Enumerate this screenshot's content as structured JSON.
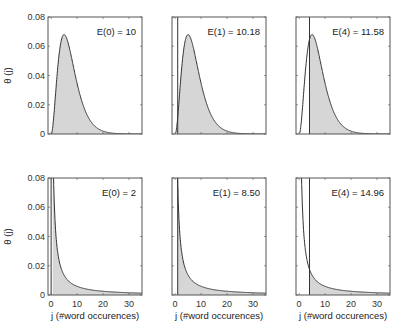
{
  "figure": {
    "ylabel": "θ (j)",
    "xlabel": "j  (#word occurences)",
    "colors": {
      "fill": "#d6d6d6",
      "line": "#333333",
      "frame": "#555555"
    }
  },
  "chart_data": [
    {
      "type": "area",
      "row": 0,
      "col": 0,
      "annotation": "E(0) = 10",
      "shape": "unimodal",
      "peak_j": 5,
      "peak_value": 0.068,
      "shade_from_j": 0,
      "vline_j": null,
      "xlim": [
        -1.2,
        35
      ],
      "ylim": [
        0,
        0.08
      ],
      "yticks": [
        "0",
        "0.02",
        "0.04",
        "0.06",
        "0.08"
      ],
      "ylabel": "θ (j)",
      "xticks": []
    },
    {
      "type": "area",
      "row": 0,
      "col": 1,
      "annotation": "E(1) = 10.18",
      "shape": "unimodal",
      "peak_j": 5,
      "peak_value": 0.068,
      "shade_from_j": 1,
      "vline_j": 1,
      "xlim": [
        -1.2,
        35
      ],
      "ylim": [
        0,
        0.08
      ],
      "yticks": [],
      "xticks": []
    },
    {
      "type": "area",
      "row": 0,
      "col": 2,
      "annotation": "E(4) = 11.58",
      "shape": "unimodal",
      "peak_j": 5,
      "peak_value": 0.068,
      "shade_from_j": 4,
      "vline_j": 4,
      "xlim": [
        -1.2,
        35
      ],
      "ylim": [
        0,
        0.08
      ],
      "yticks": [],
      "xticks": []
    },
    {
      "type": "area",
      "row": 1,
      "col": 0,
      "annotation": "E(0) = 2",
      "shape": "decay",
      "shade_from_j": 0,
      "vline_j": 0,
      "xlim": [
        -1.2,
        35
      ],
      "ylim": [
        0,
        0.08
      ],
      "yticks": [
        "0",
        "0.02",
        "0.04",
        "0.06",
        "0.08"
      ],
      "ylabel": "θ (j)",
      "xticks": [
        "0",
        "10",
        "20",
        "30"
      ],
      "xlabel": "j  (#word occurences)"
    },
    {
      "type": "area",
      "row": 1,
      "col": 1,
      "annotation": "E(1) = 8.50",
      "shape": "decay",
      "shade_from_j": 1,
      "vline_j": 1,
      "xlim": [
        -1.2,
        35
      ],
      "ylim": [
        0,
        0.08
      ],
      "yticks": [],
      "xticks": [
        "0",
        "10",
        "20",
        "30"
      ],
      "xlabel": "j  (#word occurences)"
    },
    {
      "type": "area",
      "row": 1,
      "col": 2,
      "annotation": "E(4) = 14.96",
      "shape": "decay",
      "shade_from_j": 4,
      "vline_j": 4,
      "xlim": [
        -1.2,
        35
      ],
      "ylim": [
        0,
        0.08
      ],
      "yticks": [],
      "xticks": [
        "0",
        "10",
        "20",
        "30"
      ],
      "xlabel": "j  (#word occurences)"
    }
  ]
}
